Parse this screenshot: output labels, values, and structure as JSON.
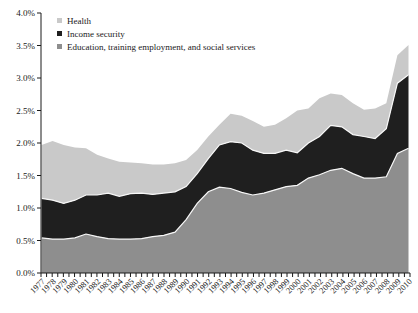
{
  "figure": {
    "background_color": "#ffffff",
    "axis_color": "#1a1a1a",
    "separator_line_color": "#f7f7f7"
  },
  "chart_data": {
    "type": "area",
    "stacked": true,
    "title": "",
    "xlabel": "",
    "ylabel": "",
    "unit": "%",
    "ylim": [
      0,
      4.0
    ],
    "ytick_step": 0.5,
    "y_tick_labels": [
      "0.0%",
      "0.5%",
      "1.0%",
      "1.5%",
      "2.0%",
      "2.5%",
      "3.0%",
      "3.5%",
      "4.0%"
    ],
    "x": [
      "1977",
      "1978",
      "1979",
      "1980",
      "1981",
      "1982",
      "1983",
      "1984",
      "1985",
      "1986",
      "1987",
      "1988",
      "1989",
      "1990",
      "1991",
      "1992",
      "1993",
      "1994",
      "1995",
      "1996",
      "1997",
      "1998",
      "1999",
      "2000",
      "2001",
      "2002",
      "2003",
      "2004",
      "2005",
      "2006",
      "2007",
      "2008",
      "2009",
      "2010"
    ],
    "grid": false,
    "legend_position": "top-left-inside",
    "series": [
      {
        "name": "Education, training employment, and social services",
        "key": "education",
        "color": "#8e8e8e",
        "values": [
          0.54,
          0.52,
          0.52,
          0.54,
          0.6,
          0.56,
          0.53,
          0.52,
          0.52,
          0.53,
          0.56,
          0.58,
          0.63,
          0.82,
          1.07,
          1.25,
          1.32,
          1.3,
          1.24,
          1.2,
          1.23,
          1.28,
          1.33,
          1.35,
          1.46,
          1.51,
          1.58,
          1.61,
          1.53,
          1.46,
          1.46,
          1.48,
          1.84,
          1.92
        ]
      },
      {
        "name": "Income security",
        "key": "income-security",
        "color": "#1f1f1f",
        "values": [
          0.61,
          0.6,
          0.55,
          0.58,
          0.6,
          0.64,
          0.7,
          0.66,
          0.7,
          0.7,
          0.65,
          0.65,
          0.62,
          0.51,
          0.46,
          0.51,
          0.65,
          0.72,
          0.76,
          0.69,
          0.61,
          0.56,
          0.56,
          0.5,
          0.54,
          0.59,
          0.69,
          0.64,
          0.6,
          0.64,
          0.61,
          0.74,
          1.08,
          1.13
        ]
      },
      {
        "name": "Health",
        "key": "health",
        "color": "#c9c9c9",
        "values": [
          0.82,
          0.91,
          0.9,
          0.81,
          0.72,
          0.62,
          0.53,
          0.53,
          0.48,
          0.46,
          0.46,
          0.44,
          0.44,
          0.41,
          0.36,
          0.34,
          0.31,
          0.43,
          0.42,
          0.45,
          0.41,
          0.44,
          0.49,
          0.65,
          0.53,
          0.59,
          0.49,
          0.49,
          0.48,
          0.41,
          0.46,
          0.39,
          0.43,
          0.46
        ]
      }
    ]
  }
}
